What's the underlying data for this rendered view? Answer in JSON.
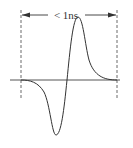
{
  "diagram": {
    "duration_label": "< 1ns",
    "colors": {
      "stroke": "#333333",
      "baseline": "#555555",
      "dash": "#444444",
      "background": "#ffffff"
    },
    "geometry": {
      "left_marker_x": 21,
      "right_marker_x": 117,
      "baseline_y": 80,
      "baseline_x_start": 10,
      "baseline_x_end": 120,
      "peak": [
        78,
        17
      ],
      "trough": [
        56,
        135
      ],
      "zero_crossing_x": 67
    }
  }
}
